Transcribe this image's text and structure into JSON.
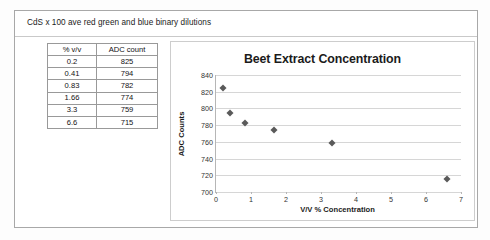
{
  "document": {
    "caption": "CdS x 100 ave  red green and blue binary dilutions"
  },
  "table": {
    "headers": [
      "% v/v",
      "ADC count"
    ],
    "rows": [
      [
        "0.2",
        "825"
      ],
      [
        "0.41",
        "794"
      ],
      [
        "0.83",
        "782"
      ],
      [
        "1.66",
        "774"
      ],
      [
        "3.3",
        "759"
      ],
      [
        "6.6",
        "715"
      ]
    ]
  },
  "chart_data": {
    "type": "scatter",
    "title": "Beet Extract Concentration",
    "xlabel": "V/V % Concentration",
    "ylabel": "ADC Counts",
    "x": [
      0.2,
      0.41,
      0.83,
      1.66,
      3.3,
      6.6
    ],
    "values": [
      825,
      794,
      782,
      774,
      759,
      715
    ],
    "xlim": [
      0,
      7
    ],
    "ylim": [
      700,
      840
    ],
    "xticks": [
      "0",
      "1",
      "2",
      "3",
      "4",
      "5",
      "6",
      "7"
    ],
    "yticks": [
      "700",
      "720",
      "740",
      "760",
      "780",
      "800",
      "820",
      "840"
    ],
    "grid": "horizontal",
    "legend": "none",
    "marker": "diamond",
    "marker_color": "#5a5a5a",
    "gridline_color": "#d6d6d6"
  }
}
